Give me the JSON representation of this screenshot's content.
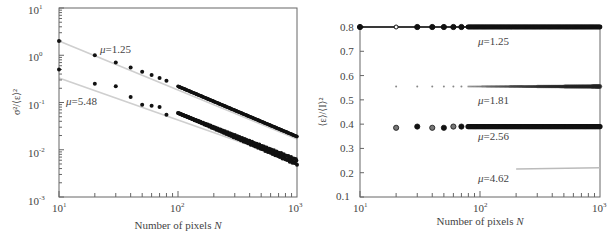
{
  "chart_data": [
    {
      "type": "scatter",
      "title": "",
      "xlabel": "Number of pixels N",
      "ylabel": "σ²/⟨ε⟩²",
      "xscale": "log",
      "yscale": "log",
      "xlim": [
        10,
        1000
      ],
      "ylim": [
        0.001,
        10
      ],
      "x_ticks": [
        "10^1",
        "10^2",
        "10^3"
      ],
      "y_ticks": [
        "10^-3",
        "10^-2",
        "10^-1",
        "10^0",
        "10^1"
      ],
      "grid": false,
      "legend": null,
      "annotations": [
        "μ=1.25",
        "μ=5.48"
      ],
      "series": [
        {
          "name": "μ=1.25",
          "x": [
            10,
            20,
            30,
            40,
            50,
            60,
            70,
            80,
            100,
            150,
            200,
            300,
            500,
            700,
            1000
          ],
          "y": [
            2.0,
            1.0,
            0.7,
            0.55,
            0.45,
            0.38,
            0.33,
            0.29,
            0.22,
            0.14,
            0.1,
            0.065,
            0.038,
            0.027,
            0.019
          ],
          "fit_line": {
            "x": [
              10,
              1000
            ],
            "y": [
              2.0,
              0.019
            ]
          }
        },
        {
          "name": "μ=5.48",
          "x": [
            10,
            20,
            30,
            40,
            50,
            60,
            70,
            80,
            100,
            150,
            200,
            300,
            500,
            700,
            1000
          ],
          "y": [
            0.5,
            0.25,
            0.22,
            0.13,
            0.09,
            0.085,
            0.08,
            0.055,
            0.06,
            0.03,
            0.023,
            0.015,
            0.0095,
            0.007,
            0.0055
          ],
          "fit_line": {
            "x": [
              10,
              1000
            ],
            "y": [
              0.35,
              0.006
            ]
          }
        }
      ]
    },
    {
      "type": "scatter",
      "title": "",
      "xlabel": "Number of pixels N",
      "ylabel": "⟨ε⟩/⟨I⟩²",
      "xscale": "log",
      "yscale": "linear",
      "xlim": [
        10,
        1000
      ],
      "ylim": [
        0.1,
        0.8
      ],
      "x_ticks": [
        "10^1",
        "10^2",
        "10^3"
      ],
      "y_ticks": [
        "0.1",
        "0.2",
        "0.3",
        "0.4",
        "0.5",
        "0.6",
        "0.7",
        "0.8"
      ],
      "grid": false,
      "legend": null,
      "annotations": [
        "μ=1.25",
        "μ=1.81",
        "μ=2.56",
        "μ=4.62"
      ],
      "series": [
        {
          "name": "μ=1.25",
          "x": [
            10,
            20,
            30,
            40,
            50,
            60,
            70,
            100,
            200,
            500,
            1000
          ],
          "y": [
            0.8,
            0.8,
            0.8,
            0.8,
            0.8,
            0.8,
            0.8,
            0.8,
            0.8,
            0.8,
            0.8
          ]
        },
        {
          "name": "μ=1.81",
          "x": [
            20,
            30,
            40,
            50,
            60,
            70,
            100,
            200,
            500,
            1000
          ],
          "y": [
            0.555,
            0.555,
            0.555,
            0.555,
            0.555,
            0.555,
            0.555,
            0.555,
            0.555,
            0.555
          ]
        },
        {
          "name": "μ=2.56",
          "x": [
            20,
            30,
            40,
            50,
            60,
            70,
            100,
            200,
            500,
            1000
          ],
          "y": [
            0.385,
            0.39,
            0.385,
            0.385,
            0.39,
            0.39,
            0.39,
            0.39,
            0.39,
            0.39
          ]
        },
        {
          "name": "μ=4.62",
          "x": [
            200,
            300,
            500,
            700,
            1000
          ],
          "y": [
            0.215,
            0.218,
            0.22,
            0.22,
            0.22
          ]
        }
      ]
    }
  ],
  "left": {
    "y_axis_label": "σ²/⟨ε⟩²",
    "x_axis_label_prefix": "Number of pixels ",
    "x_axis_label_var": "N",
    "y_tick_labels": [
      {
        "base": "10",
        "exp": "1"
      },
      {
        "base": "10",
        "exp": "0"
      },
      {
        "base": "10",
        "exp": "-1"
      },
      {
        "base": "10",
        "exp": "-2"
      },
      {
        "base": "10",
        "exp": "-3"
      }
    ],
    "x_tick_labels": [
      {
        "base": "10",
        "exp": "1"
      },
      {
        "base": "10",
        "exp": "2"
      },
      {
        "base": "10",
        "exp": "3"
      }
    ],
    "annotations": [
      {
        "mu": "μ",
        "text": "=1.25"
      },
      {
        "mu": "μ",
        "text": "=5.48"
      }
    ]
  },
  "right": {
    "y_axis_label": "⟨ε⟩/⟨I⟩²",
    "x_axis_label_prefix": "Number of pixels ",
    "x_axis_label_var": "N",
    "y_tick_labels": [
      "0.8",
      "0.7",
      "0.6",
      "0.5",
      "0.4",
      "0.3",
      "0.2",
      "0.1"
    ],
    "x_tick_labels": [
      {
        "base": "10",
        "exp": "1"
      },
      {
        "base": "10",
        "exp": "2"
      },
      {
        "base": "10",
        "exp": "3"
      }
    ],
    "annotations": [
      {
        "mu": "μ",
        "text": "=1.25"
      },
      {
        "mu": "μ",
        "text": "=1.81"
      },
      {
        "mu": "μ",
        "text": "=2.56"
      },
      {
        "mu": "μ",
        "text": "=4.62"
      }
    ]
  },
  "colors": {
    "axis": "#555555",
    "marker": "#111111",
    "fit_line": "#c8c8c8",
    "text": "#444444"
  }
}
